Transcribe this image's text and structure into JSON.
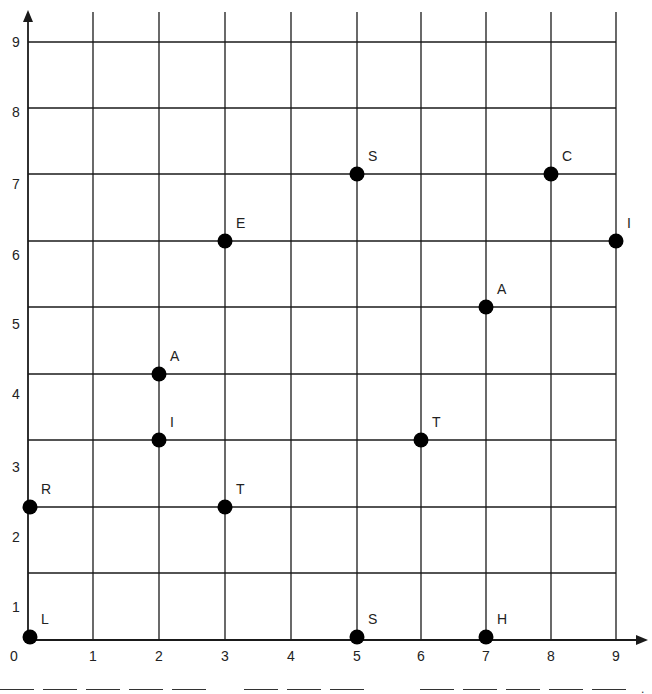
{
  "chart_data": {
    "type": "scatter",
    "title": "",
    "xlabel": "",
    "ylabel": "",
    "xlim": [
      0,
      9
    ],
    "ylim": [
      0,
      9
    ],
    "grid": true,
    "x_ticks": [
      "0",
      "1",
      "2",
      "3",
      "4",
      "5",
      "6",
      "7",
      "8",
      "9"
    ],
    "y_ticks": [
      "0",
      "1",
      "2",
      "3",
      "4",
      "5",
      "6",
      "7",
      "8",
      "9"
    ],
    "points": [
      {
        "label": "L",
        "x": 0,
        "y": 0
      },
      {
        "label": "R",
        "x": 0,
        "y": 2
      },
      {
        "label": "T",
        "x": 3,
        "y": 2
      },
      {
        "label": "I",
        "x": 2,
        "y": 3
      },
      {
        "label": "A",
        "x": 2,
        "y": 4
      },
      {
        "label": "E",
        "x": 3,
        "y": 6
      },
      {
        "label": "S",
        "x": 5,
        "y": 7
      },
      {
        "label": "C",
        "x": 8,
        "y": 7
      },
      {
        "label": "I",
        "x": 9,
        "y": 6
      },
      {
        "label": "A",
        "x": 7,
        "y": 5
      },
      {
        "label": "T",
        "x": 6,
        "y": 3
      },
      {
        "label": "S",
        "x": 5,
        "y": 0
      },
      {
        "label": "H",
        "x": 7,
        "y": 0
      }
    ]
  },
  "answer_blanks": {
    "groups": [
      5,
      3,
      5
    ],
    "terminator": "."
  },
  "colors": {
    "line": "#1a1a1a",
    "point": "#000000",
    "text": "#222222"
  }
}
